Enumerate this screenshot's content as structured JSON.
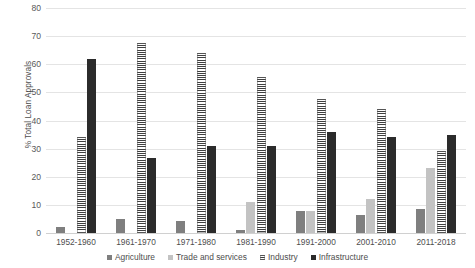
{
  "chart_data": {
    "type": "bar",
    "title": "",
    "subtitle": "",
    "xlabel": "",
    "ylabel": "% Total Loan Approvals",
    "ylim": [
      0,
      80
    ],
    "ytick_labels": [
      "0",
      "10",
      "20",
      "30",
      "40",
      "50",
      "60",
      "70",
      "80"
    ],
    "ytick_values": [
      0,
      10,
      20,
      30,
      40,
      50,
      60,
      70,
      80
    ],
    "grid": "horizontal",
    "legend_position": "bottom-center",
    "categories": [
      "1952-1960",
      "1961-1970",
      "1971-1980",
      "1981-1990",
      "1991-2000",
      "2001-2010",
      "2011-2018"
    ],
    "series": [
      {
        "name": "Agriculture",
        "color": "#7f7f7f",
        "pattern": "solid",
        "values": [
          2.0,
          5.0,
          4.2,
          1.0,
          8.0,
          6.5,
          8.5
        ]
      },
      {
        "name": "Trade and services",
        "color": "#c3c3c3",
        "pattern": "solid",
        "values": [
          0.0,
          0.0,
          0.0,
          11.0,
          8.0,
          12.0,
          23.0
        ]
      },
      {
        "name": "Industry",
        "color": "#3f3f3f",
        "pattern": "horizontal-hatch",
        "values": [
          34.0,
          67.5,
          64.0,
          55.5,
          47.5,
          44.0,
          29.0
        ]
      },
      {
        "name": "Infrastructure",
        "color": "#2b2b2b",
        "pattern": "solid",
        "values": [
          62.0,
          26.5,
          31.0,
          31.0,
          36.0,
          34.0,
          35.0
        ]
      }
    ]
  },
  "legend": {
    "items": [
      {
        "label": "Agriculture"
      },
      {
        "label": "Trade and services"
      },
      {
        "label": "Industry"
      },
      {
        "label": "Infrastructure"
      }
    ]
  }
}
